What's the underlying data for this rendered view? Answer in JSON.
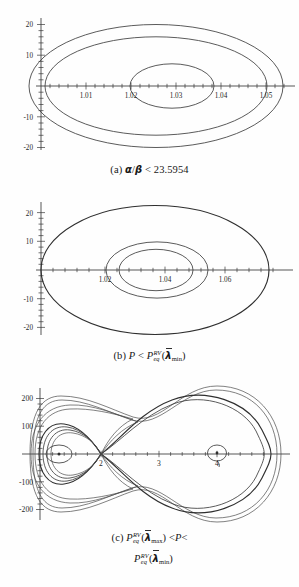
{
  "figure": {
    "background_color": "#fefefe",
    "curve_color": "#3d3d3d",
    "axis_color": "#3a3a3a",
    "panels": [
      {
        "id": "a",
        "caption_label": "(a)",
        "caption_text": "(a) α/β < 23.5954",
        "caption_parts": {
          "label": "(a)",
          "alpha": "α",
          "slash": "/",
          "beta": "β",
          "relation": "<",
          "value": "23.5954"
        },
        "chart": {
          "type": "line",
          "title": "",
          "xlabel": "",
          "ylabel": "",
          "xlim": [
            1.0,
            1.057
          ],
          "ylim": [
            -21,
            21
          ],
          "xticks": [
            1.01,
            1.02,
            1.03,
            1.04,
            1.05
          ],
          "xticklabels": [
            "1.01",
            "1.02",
            "1.03",
            "1.04",
            "1.05"
          ],
          "yticks": [
            20,
            10,
            -10,
            -20
          ],
          "yticklabels": [
            "20",
            "10",
            "-10",
            "-20"
          ],
          "grid": false,
          "legend": "none",
          "description": "Three nested closed phase-plane orbits (ellipse-like), all anchored near x = 1.0 on the left.",
          "orbits": [
            {
              "name": "outer",
              "x_left": 1.0005,
              "x_right": 1.0555,
              "y_max": 20.0,
              "y_min": -20.0
            },
            {
              "name": "middle",
              "x_left": 1.0055,
              "x_right": 1.0505,
              "y_max": 16.0,
              "y_min": -16.0
            },
            {
              "name": "inner",
              "x_left": 1.0195,
              "x_right": 1.0378,
              "y_max": 7.2,
              "y_min": -7.2
            }
          ]
        }
      },
      {
        "id": "b",
        "caption_label": "(b)",
        "caption_text": "(b) P < P_eq^RV(λ̄_min)",
        "caption_parts": {
          "label": "(b)",
          "p_symbol": "P",
          "relation": "<",
          "p_eq_symbol": "P",
          "superscript": "RV",
          "subscript": "eq",
          "open_paren": "(",
          "lambda": "λ",
          "lambda_sub": "min",
          "close_paren": ")"
        },
        "chart": {
          "type": "line",
          "title": "",
          "xlabel": "",
          "ylabel": "",
          "xlim": [
            1.0,
            1.078
          ],
          "ylim": [
            -24,
            24
          ],
          "xticks": [
            1.02,
            1.04,
            1.06
          ],
          "xticklabels": [
            "1.02",
            "1.04",
            "1.06"
          ],
          "yticks": [
            20,
            10,
            -10,
            -20
          ],
          "yticklabels": [
            "20",
            "10",
            "-10",
            "-20"
          ],
          "grid": false,
          "legend": "none",
          "description": "Three nested closed orbits; the outer one is large and anchored at x = 1.0, the two inner ones are concentric around x ≈ 1.037.",
          "orbits": [
            {
              "name": "outer",
              "x_left": 1.0005,
              "x_right": 1.0755,
              "y_max": 22.5,
              "y_min": -22.5
            },
            {
              "name": "middle",
              "x_left": 1.0215,
              "x_right": 1.0555,
              "y_max": 9.8,
              "y_min": -9.8
            },
            {
              "name": "inner",
              "x_left": 1.0262,
              "x_right": 1.0508,
              "y_max": 7.2,
              "y_min": -7.2
            }
          ]
        }
      },
      {
        "id": "c",
        "caption_label": "(c)",
        "caption_text": "(c) P_eq^RV(λ̄_max) < P < P_eq^RV(λ̄_min)",
        "caption_parts": {
          "label": "(c)",
          "p_eq_symbol": "P",
          "superscript": "RV",
          "subscript": "eq",
          "open_paren": "(",
          "lambda": "λ",
          "lambda_sub_max": "max",
          "lambda_sub_min": "min",
          "close_paren": ")",
          "relation": "<",
          "p_symbol": "P"
        },
        "chart": {
          "type": "line",
          "title": "",
          "xlabel": "",
          "ylabel": "",
          "xlim": [
            0.55,
            5.0
          ],
          "ylim": [
            -265,
            265
          ],
          "xticks": [
            2,
            3,
            4
          ],
          "xticklabels": [
            "2",
            "3",
            "4"
          ],
          "yticks": [
            200,
            100,
            -100,
            -200
          ],
          "yticklabels": [
            "200",
            "100",
            "-100",
            "-200"
          ],
          "grid": false,
          "legend": "none",
          "description": "Figure-eight separatrix phase portrait with a saddle point near x = 2, a small center near x = 1.05 inside the small left lobe, a center near x = 4 inside the large right lobe, and several nested trajectories surrounding each lobe.",
          "features": [
            {
              "name": "saddle-point",
              "x": 2.0,
              "y": 0
            },
            {
              "name": "left-center",
              "x": 1.05,
              "y": 0
            },
            {
              "name": "right-center",
              "x": 4.0,
              "y": 0
            }
          ],
          "orbits": [
            {
              "name": "left-small-orbit",
              "x_left": 0.82,
              "x_right": 1.3,
              "y_max": 22,
              "y_min": -22
            },
            {
              "name": "left-inner-separatrix-group",
              "x_left": 0.66,
              "x_right": 2.0,
              "y_max": 92,
              "y_min": -92
            },
            {
              "name": "left-lobe-separatrix",
              "x_left": 0.64,
              "x_right": 2.0,
              "y_max": 100,
              "y_min": -100
            },
            {
              "name": "outer-enclosing-orbit",
              "x_left": 0.58,
              "x_right": 4.82,
              "y_max": 128,
              "y_min": -128
            },
            {
              "name": "right-small-orbit",
              "x_left": 3.85,
              "x_right": 4.18,
              "y_max": 14,
              "y_min": -14
            },
            {
              "name": "right-lobe-separatrix",
              "x_left": 2.0,
              "x_right": 4.78,
              "y_max": 250,
              "y_min": -250
            }
          ]
        }
      }
    ]
  }
}
